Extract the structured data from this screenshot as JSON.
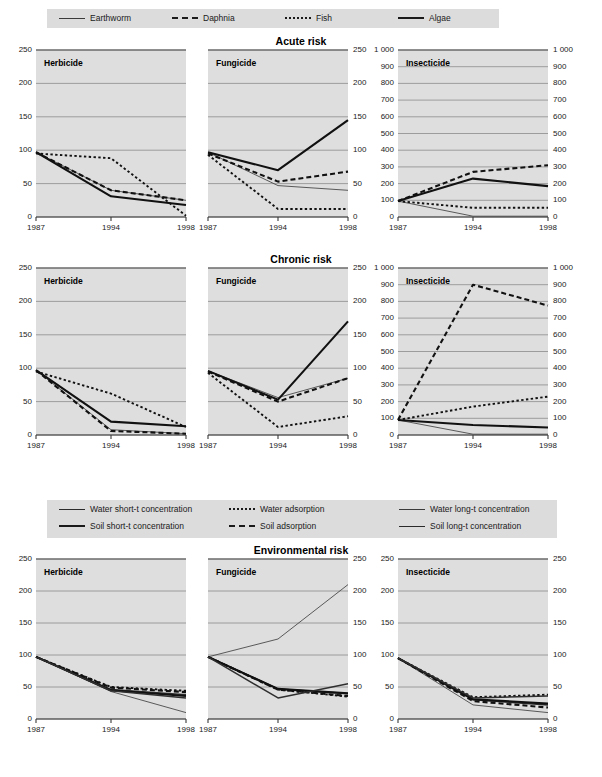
{
  "figure": {
    "row_titles": [
      "Acute risk",
      "Chronic risk",
      "Environmental risk"
    ],
    "panel_labels": [
      "Herbicide",
      "Fungicide",
      "Insecticide"
    ],
    "x_ticks": [
      "1987",
      "1994",
      "1998"
    ],
    "y_ticks_250": [
      "0",
      "50",
      "100",
      "150",
      "200",
      "250"
    ],
    "y_ticks_1000": [
      "0",
      "100",
      "200",
      "300",
      "400",
      "500",
      "600",
      "700",
      "800",
      "900",
      "1 000"
    ],
    "colors": {
      "plot_bg": "#dedede",
      "legend_bg": "#dcdcdc",
      "gridline": "#8c8c8c",
      "axis": "#4a4a4a",
      "text": "#1a1a1a"
    }
  },
  "legend_top": {
    "items": [
      {
        "label": "Earthworm",
        "style": "solid-thin"
      },
      {
        "label": "Daphnia",
        "style": "dashed-bold"
      },
      {
        "label": "Fish",
        "style": "dotted"
      },
      {
        "label": "Algae",
        "style": "solid-bold"
      }
    ]
  },
  "legend_env": {
    "items": [
      {
        "label": "Water short-t concentration",
        "style": "solid-mid"
      },
      {
        "label": "Water adsorption",
        "style": "dotted"
      },
      {
        "label": "Water long-t concentration",
        "style": "solid-thin"
      },
      {
        "label": "Soil short-t concentration",
        "style": "solid-bold"
      },
      {
        "label": "Soil adsorption",
        "style": "dashed-bold"
      },
      {
        "label": "Soil long-t concentration",
        "style": "solid-mid"
      }
    ]
  },
  "chart_data": {
    "type": "line",
    "x": [
      1987,
      1994,
      1998
    ],
    "xlabel": "",
    "ylabel": "Index (1987 = 100)",
    "grid": true,
    "legend_position": "top",
    "panels": [
      {
        "row": "Acute risk",
        "column": "Herbicide",
        "ylim": [
          0,
          250
        ],
        "yticks": [
          0,
          50,
          100,
          150,
          200,
          250
        ],
        "series": [
          {
            "name": "Earthworm",
            "style": "solid-thin",
            "values": [
              97,
              40,
              25
            ]
          },
          {
            "name": "Daphnia",
            "style": "dashed-bold",
            "values": [
              97,
              40,
              25
            ]
          },
          {
            "name": "Fish",
            "style": "dotted",
            "values": [
              95,
              88,
              2
            ]
          },
          {
            "name": "Algae",
            "style": "solid-bold",
            "values": [
              97,
              31,
              18
            ]
          }
        ]
      },
      {
        "row": "Acute risk",
        "column": "Fungicide",
        "ylim": [
          0,
          250
        ],
        "yticks": [
          0,
          50,
          100,
          150,
          200,
          250
        ],
        "series": [
          {
            "name": "Earthworm",
            "style": "solid-thin",
            "values": [
              97,
              47,
              40
            ]
          },
          {
            "name": "Daphnia",
            "style": "dashed-bold",
            "values": [
              95,
              53,
              68
            ]
          },
          {
            "name": "Fish",
            "style": "dotted",
            "values": [
              93,
              12,
              12
            ]
          },
          {
            "name": "Algae",
            "style": "solid-bold",
            "values": [
              97,
              70,
              145
            ]
          }
        ]
      },
      {
        "row": "Acute risk",
        "column": "Insecticide",
        "ylim": [
          0,
          1000
        ],
        "yticks": [
          0,
          100,
          200,
          300,
          400,
          500,
          600,
          700,
          800,
          900,
          1000
        ],
        "series": [
          {
            "name": "Earthworm",
            "style": "solid-thin",
            "values": [
              95,
              5,
              5
            ]
          },
          {
            "name": "Daphnia",
            "style": "dashed-bold",
            "values": [
              95,
              270,
              310
            ]
          },
          {
            "name": "Fish",
            "style": "dotted",
            "values": [
              95,
              55,
              55
            ]
          },
          {
            "name": "Algae",
            "style": "solid-bold",
            "values": [
              95,
              230,
              185
            ]
          }
        ]
      },
      {
        "row": "Chronic risk",
        "column": "Herbicide",
        "ylim": [
          0,
          250
        ],
        "yticks": [
          0,
          50,
          100,
          150,
          200,
          250
        ],
        "series": [
          {
            "name": "Earthworm",
            "style": "solid-thin",
            "values": [
              97,
              8,
              2
            ]
          },
          {
            "name": "Daphnia",
            "style": "dashed-bold",
            "values": [
              97,
              6,
              2
            ]
          },
          {
            "name": "Fish",
            "style": "dotted",
            "values": [
              95,
              62,
              12
            ]
          },
          {
            "name": "Algae",
            "style": "solid-bold",
            "values": [
              97,
              20,
              13
            ]
          }
        ]
      },
      {
        "row": "Chronic risk",
        "column": "Fungicide",
        "ylim": [
          0,
          250
        ],
        "yticks": [
          0,
          50,
          100,
          150,
          200,
          250
        ],
        "series": [
          {
            "name": "Earthworm",
            "style": "solid-thin",
            "values": [
              96,
              56,
              85
            ]
          },
          {
            "name": "Daphnia",
            "style": "dashed-bold",
            "values": [
              95,
              50,
              85
            ]
          },
          {
            "name": "Fish",
            "style": "dotted",
            "values": [
              93,
              12,
              28
            ]
          },
          {
            "name": "Algae",
            "style": "solid-bold",
            "values": [
              96,
              53,
              170
            ]
          }
        ]
      },
      {
        "row": "Chronic risk",
        "column": "Insecticide",
        "ylim": [
          0,
          1000
        ],
        "yticks": [
          0,
          100,
          200,
          300,
          400,
          500,
          600,
          700,
          800,
          900,
          1000
        ],
        "series": [
          {
            "name": "Earthworm",
            "style": "solid-thin",
            "values": [
              90,
              5,
              5
            ]
          },
          {
            "name": "Daphnia",
            "style": "dashed-bold",
            "values": [
              90,
              900,
              775
            ]
          },
          {
            "name": "Fish",
            "style": "dotted",
            "values": [
              90,
              170,
              230
            ]
          },
          {
            "name": "Algae",
            "style": "solid-bold",
            "values": [
              90,
              60,
              45
            ]
          }
        ]
      },
      {
        "row": "Environmental risk",
        "column": "Herbicide",
        "ylim": [
          0,
          250
        ],
        "yticks": [
          0,
          50,
          100,
          150,
          200,
          250
        ],
        "series": [
          {
            "name": "Water short-t concentration",
            "style": "solid-mid",
            "values": [
              97,
              46,
              38
            ]
          },
          {
            "name": "Water adsorption",
            "style": "dotted",
            "values": [
              97,
              50,
              44
            ]
          },
          {
            "name": "Water long-t concentration",
            "style": "solid-thin",
            "values": [
              97,
              43,
              10
            ]
          },
          {
            "name": "Soil short-t concentration",
            "style": "solid-bold",
            "values": [
              97,
              45,
              36
            ]
          },
          {
            "name": "Soil adsorption",
            "style": "dashed-bold",
            "values": [
              97,
              49,
              42
            ]
          },
          {
            "name": "Soil long-t concentration",
            "style": "solid-mid",
            "values": [
              97,
              44,
              33
            ]
          }
        ]
      },
      {
        "row": "Environmental risk",
        "column": "Fungicide",
        "ylim": [
          0,
          250
        ],
        "yticks": [
          0,
          50,
          100,
          150,
          200,
          250
        ],
        "series": [
          {
            "name": "Water short-t concentration",
            "style": "solid-mid",
            "values": [
              97,
              47,
              40
            ]
          },
          {
            "name": "Water adsorption",
            "style": "dotted",
            "values": [
              97,
              46,
              35
            ]
          },
          {
            "name": "Water long-t concentration",
            "style": "solid-thin",
            "values": [
              97,
              125,
              210
            ]
          },
          {
            "name": "Soil short-t concentration",
            "style": "solid-bold",
            "values": [
              97,
              47,
              40
            ]
          },
          {
            "name": "Soil adsorption",
            "style": "dashed-bold",
            "values": [
              97,
              46,
              36
            ]
          },
          {
            "name": "Soil long-t concentration",
            "style": "solid-mid",
            "values": [
              97,
              33,
              55
            ]
          }
        ]
      },
      {
        "row": "Environmental risk",
        "column": "Insecticide",
        "ylim": [
          0,
          250
        ],
        "yticks": [
          0,
          50,
          100,
          150,
          200,
          250
        ],
        "series": [
          {
            "name": "Water short-t concentration",
            "style": "solid-mid",
            "values": [
              95,
              30,
              22
            ]
          },
          {
            "name": "Water adsorption",
            "style": "dotted",
            "values": [
              95,
              34,
              38
            ]
          },
          {
            "name": "Water long-t concentration",
            "style": "solid-thin",
            "values": [
              95,
              22,
              10
            ]
          },
          {
            "name": "Soil short-t concentration",
            "style": "solid-bold",
            "values": [
              95,
              31,
              24
            ]
          },
          {
            "name": "Soil adsorption",
            "style": "dashed-bold",
            "values": [
              95,
              28,
              18
            ]
          },
          {
            "name": "Soil long-t concentration",
            "style": "solid-mid",
            "values": [
              95,
              33,
              36
            ]
          }
        ]
      }
    ]
  }
}
